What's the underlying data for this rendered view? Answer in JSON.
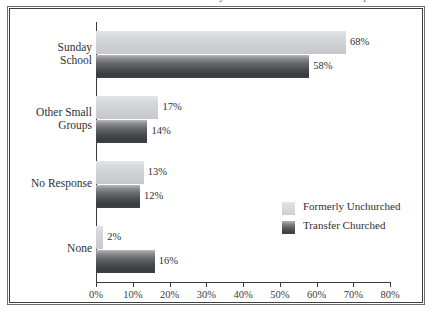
{
  "title_sliver": "Current Involvement in Sunday School or Other Small Groups",
  "chart_data": {
    "type": "bar",
    "orientation": "horizontal",
    "title": "",
    "xlabel": "",
    "ylabel": "",
    "categories": [
      "Sunday School",
      "Other Small Groups",
      "No Response",
      "None"
    ],
    "category_lines": [
      [
        "Sunday",
        "School"
      ],
      [
        "Other Small",
        "Groups"
      ],
      [
        "No Response"
      ],
      [
        "None"
      ]
    ],
    "series": [
      {
        "name": "Formerly Unchurched",
        "color": "#d0d1d4",
        "values": [
          68,
          17,
          13,
          2
        ],
        "labels": [
          "68%",
          "17%",
          "13%",
          "2%"
        ]
      },
      {
        "name": "Transfer Churched",
        "color": "#48494d",
        "values": [
          58,
          14,
          12,
          16
        ],
        "labels": [
          "58%",
          "14%",
          "12%",
          "16%"
        ]
      }
    ],
    "xlim": [
      0,
      80
    ],
    "xticks": [
      0,
      10,
      20,
      30,
      40,
      50,
      60,
      70,
      80
    ],
    "xticklabels": [
      "0%",
      "10%",
      "20%",
      "30%",
      "40%",
      "50%",
      "60%",
      "70%",
      "80%"
    ],
    "grid": false,
    "legend_position": "inside-lower-right"
  },
  "legend": {
    "entries": [
      {
        "label": "Formerly Unchurched",
        "swatch": "light"
      },
      {
        "label": "Transfer Churched",
        "swatch": "dark"
      }
    ]
  }
}
